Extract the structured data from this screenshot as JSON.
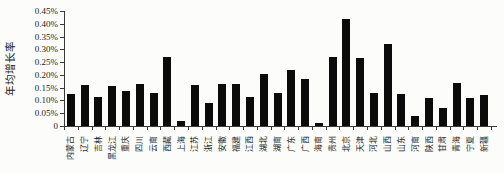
{
  "chart_data": {
    "type": "bar",
    "title": "",
    "xlabel": "",
    "ylabel": "年均增长率",
    "unit": "%",
    "ylim": [
      0,
      0.45
    ],
    "grid": false,
    "legend": "none",
    "bar_color": "#0b0b0b",
    "y_ticks": [
      "0.45%",
      "0.40%",
      "0.35%",
      "0.30%",
      "0.25%",
      "0.20%",
      "0.15%",
      "0.10%",
      "0.05%",
      "0"
    ],
    "categories": [
      "内蒙古",
      "辽宁",
      "吉林",
      "黑龙江",
      "重庆",
      "四川",
      "云南",
      "西藏",
      "上海",
      "江苏",
      "浙江",
      "安徽",
      "福建",
      "江西",
      "湖北",
      "湖南",
      "广东",
      "广西",
      "海南",
      "贵州",
      "北京",
      "天津",
      "河北",
      "山西",
      "山东",
      "河南",
      "陕西",
      "甘肃",
      "青海",
      "宁夏",
      "新疆"
    ],
    "values": [
      0.125,
      0.16,
      0.115,
      0.155,
      0.135,
      0.165,
      0.13,
      0.27,
      0.02,
      0.16,
      0.09,
      0.165,
      0.165,
      0.115,
      0.205,
      0.13,
      0.22,
      0.185,
      0.01,
      0.27,
      0.42,
      0.265,
      0.13,
      0.32,
      0.125,
      0.04,
      0.11,
      0.07,
      0.17,
      0.11,
      0.12
    ]
  }
}
